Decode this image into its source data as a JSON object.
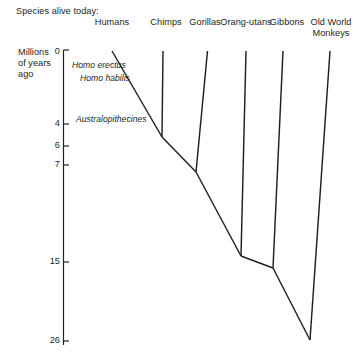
{
  "caption": {
    "species_alive_today": "Species alive today:"
  },
  "axis": {
    "title_line1": "Millions",
    "title_line2": "of years",
    "title_line3": "ago",
    "unit": "Millions of years ago",
    "ticks": [
      {
        "label": "0",
        "value": 0,
        "y": 52
      },
      {
        "label": "4",
        "value": 4,
        "y": 124
      },
      {
        "label": "6",
        "value": 6,
        "y": 146
      },
      {
        "label": "7",
        "value": 7,
        "y": 165
      },
      {
        "label": "15",
        "value": 15,
        "y": 262
      },
      {
        "label": "26",
        "value": 26,
        "y": 341
      }
    ]
  },
  "species": [
    {
      "name": "Humans",
      "label": "Humans",
      "label2": "",
      "x": 112,
      "label_x": 112
    },
    {
      "name": "Chimps",
      "label": "Chimps",
      "label2": "",
      "x": 163,
      "label_x": 166
    },
    {
      "name": "Gorillas",
      "label": "Gorillas",
      "label2": "",
      "x": 207,
      "label_x": 205
    },
    {
      "name": "Orang-utans",
      "label": "Orang-utans",
      "label2": "",
      "x": 246,
      "label_x": 246
    },
    {
      "name": "Gibbons",
      "label": "Gibbons",
      "label2": "",
      "x": 283,
      "label_x": 287
    },
    {
      "name": "Old World Monkeys",
      "label": "Old World",
      "label2": "Monkeys",
      "x": 330,
      "label_x": 331
    }
  ],
  "fossil_labels": [
    {
      "text": "Homo erectus",
      "x": 72,
      "y": 65
    },
    {
      "text": "Homo habilis",
      "x": 80,
      "y": 78
    },
    {
      "text": "Australopithecines",
      "x": 76,
      "y": 119
    }
  ],
  "nodes": [
    {
      "name": "human-chimp-split",
      "x": 162,
      "y": 137,
      "mya": 6
    },
    {
      "name": "gorilla-split",
      "x": 196,
      "y": 172,
      "mya": 7
    },
    {
      "name": "orangutan-split",
      "x": 241,
      "y": 256,
      "mya": 15
    },
    {
      "name": "gibbon-split",
      "x": 273,
      "y": 268,
      "mya": 15
    },
    {
      "name": "monkey-split",
      "x": 310,
      "y": 340,
      "mya": 26
    }
  ],
  "colors": {
    "ink": "#231f20",
    "background": "#ffffff"
  }
}
